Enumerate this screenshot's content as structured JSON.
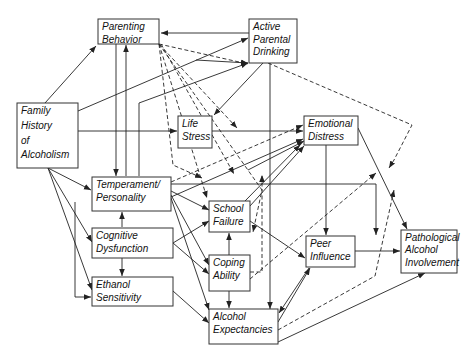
{
  "diagram": {
    "type": "causal path model",
    "nodes": [
      {
        "id": "parenting",
        "lines": [
          "Parenting",
          "Behavior"
        ],
        "x": 98,
        "y": 19,
        "w": 61,
        "h": 25
      },
      {
        "id": "apd",
        "lines": [
          "Active",
          "Parental",
          "Drinking"
        ],
        "x": 249,
        "y": 19,
        "w": 48,
        "h": 44
      },
      {
        "id": "fha",
        "lines": [
          "Family",
          "History",
          "of",
          "Alcoholism"
        ],
        "x": 17,
        "y": 103,
        "w": 61,
        "h": 65
      },
      {
        "id": "life",
        "lines": [
          "Life",
          "Stress"
        ],
        "x": 178,
        "y": 116,
        "w": 34,
        "h": 32
      },
      {
        "id": "emo",
        "lines": [
          "Emotional",
          "Distress"
        ],
        "x": 304,
        "y": 116,
        "w": 54,
        "h": 29
      },
      {
        "id": "temp",
        "lines": [
          "Temperament/",
          "Personality"
        ],
        "x": 92,
        "y": 177,
        "w": 79,
        "h": 34
      },
      {
        "id": "school",
        "lines": [
          "School",
          "Failure"
        ],
        "x": 209,
        "y": 201,
        "w": 41,
        "h": 31
      },
      {
        "id": "cog",
        "lines": [
          "Cognitive",
          "Dysfunction"
        ],
        "x": 92,
        "y": 228,
        "w": 81,
        "h": 30
      },
      {
        "id": "coping",
        "lines": [
          "Coping",
          "Ability"
        ],
        "x": 209,
        "y": 255,
        "w": 41,
        "h": 36
      },
      {
        "id": "eth",
        "lines": [
          "Ethanol",
          "Sensitivity"
        ],
        "x": 92,
        "y": 277,
        "w": 81,
        "h": 29
      },
      {
        "id": "peer",
        "lines": [
          "Peer",
          "Influence"
        ],
        "x": 306,
        "y": 236,
        "w": 49,
        "h": 31
      },
      {
        "id": "path",
        "lines": [
          "Pathological",
          "Alcohol",
          "Involvement"
        ],
        "x": 401,
        "y": 230,
        "w": 56,
        "h": 43
      },
      {
        "id": "exp",
        "lines": [
          "Alcohol",
          "Expectancies"
        ],
        "x": 209,
        "y": 309,
        "w": 69,
        "h": 35
      }
    ],
    "edges": [
      {
        "d": "M45,103 L96,46",
        "style": "solid"
      },
      {
        "d": "M78,111 L248,38",
        "style": "solid"
      },
      {
        "d": "M78,131 L177,131",
        "style": "solid"
      },
      {
        "d": "M48,168 L91,190",
        "style": "solid"
      },
      {
        "d": "M48,168 L92,242",
        "style": "solid"
      },
      {
        "d": "M48,168 L92,290",
        "style": "solid"
      },
      {
        "d": "M296,33 L161,33",
        "style": "solid"
      },
      {
        "d": "M116,44 L116,176",
        "style": "solid"
      },
      {
        "d": "M126,176 L126,45",
        "style": "solid"
      },
      {
        "d": "M196,60 L248,63",
        "style": "solid"
      },
      {
        "d": "M139,176 L139,103 L248,63",
        "style": "solid"
      },
      {
        "d": "M263,63 L214,115",
        "style": "solid"
      },
      {
        "d": "M212,131 L303,131",
        "style": "solid"
      },
      {
        "d": "M171,197 L303,139",
        "style": "solid"
      },
      {
        "d": "M171,182 L303,125",
        "style": "dashed"
      },
      {
        "d": "M159,44 L248,64",
        "style": "dashed"
      },
      {
        "d": "M159,44 L237,128",
        "style": "dashed"
      },
      {
        "d": "M159,44 L207,198",
        "style": "dashed"
      },
      {
        "d": "M159,44 L262,190 L253,232",
        "style": "dashed"
      },
      {
        "d": "M159,44 L173,165 L202,178",
        "style": "dashed"
      },
      {
        "d": "M161,44 L234,174",
        "style": "dashed"
      },
      {
        "d": "M268,63 L412,125 L394,160 L389,168",
        "style": "dashed"
      },
      {
        "d": "M171,184 L376,184 L376,235",
        "style": "solid"
      },
      {
        "d": "M171,191 L209,210",
        "style": "solid"
      },
      {
        "d": "M171,195 L209,265",
        "style": "solid"
      },
      {
        "d": "M171,198 L209,310",
        "style": "solid"
      },
      {
        "d": "M75,202 L75,297 L91,297",
        "style": "solid"
      },
      {
        "d": "M122,227 L122,212",
        "style": "solid"
      },
      {
        "d": "M122,258 L122,276",
        "style": "solid"
      },
      {
        "d": "M173,243 L209,221",
        "style": "solid"
      },
      {
        "d": "M173,243 L209,274",
        "style": "solid"
      },
      {
        "d": "M173,291 L209,323",
        "style": "solid"
      },
      {
        "d": "M229,255 L229,233",
        "style": "solid"
      },
      {
        "d": "M229,291 L229,308",
        "style": "solid"
      },
      {
        "d": "M250,221 L305,258",
        "style": "solid"
      },
      {
        "d": "M250,272 L262,272 L262,175",
        "style": "dashed"
      },
      {
        "d": "M250,279 L376,173",
        "style": "dashed"
      },
      {
        "d": "M270,63 L270,309",
        "style": "solid"
      },
      {
        "d": "M326,145 L326,235",
        "style": "solid"
      },
      {
        "d": "M358,128 L407,229",
        "style": "solid"
      },
      {
        "d": "M355,251 L400,251",
        "style": "solid"
      },
      {
        "d": "M309,268 L279,313",
        "style": "solid"
      },
      {
        "d": "M278,322 L310,268",
        "style": "solid"
      },
      {
        "d": "M278,330 L375,276 L394,190",
        "style": "dashed"
      },
      {
        "d": "M278,342 L425,273",
        "style": "solid"
      },
      {
        "d": "M248,170 L304,141",
        "style": "solid"
      },
      {
        "d": "M250,206 L304,146",
        "style": "solid"
      },
      {
        "d": "M245,201 L300,145",
        "style": "solid"
      }
    ]
  }
}
